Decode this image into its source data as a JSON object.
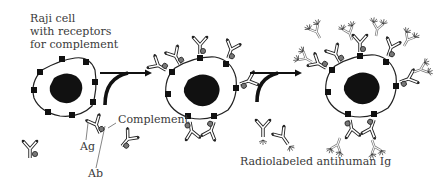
{
  "diagram": {
    "title_label": {
      "line1": "Raji cell",
      "line2": "with receptors",
      "line3": "for complement"
    },
    "labels": {
      "complement": "Complement",
      "ag": "Ag",
      "ab": "Ab",
      "radiolabeled": "Radiolabeled antihuman Ig"
    },
    "stages": [
      {
        "name": "raji-cell-with-receptors"
      },
      {
        "name": "cell-with-bound-immune-complexes"
      },
      {
        "name": "cell-with-radiolabeled-antihuman-ig"
      }
    ],
    "colors": {
      "ink": "#1a1a1a",
      "text": "#3a3a3a",
      "background": "#ffffff"
    }
  }
}
